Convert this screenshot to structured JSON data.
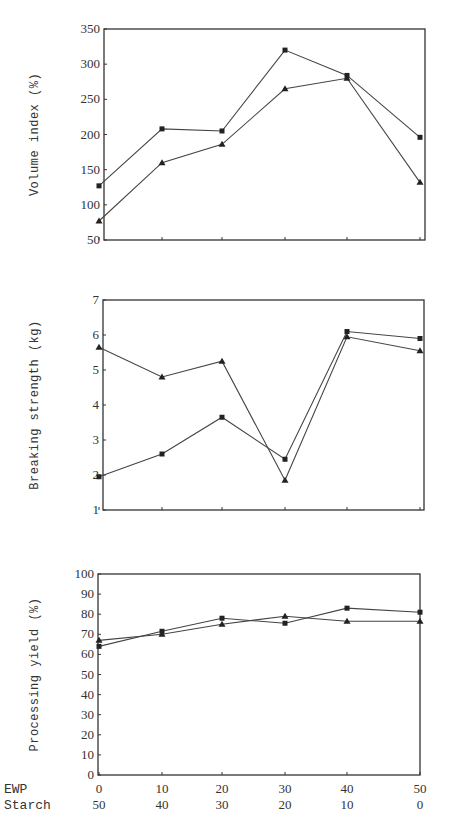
{
  "chart_data": [
    {
      "type": "line",
      "title": "",
      "xlabel": "EWP / Starch",
      "ylabel": "Volume index (%)",
      "x": [
        0,
        10,
        20,
        30,
        40,
        50
      ],
      "x_secondary": [
        50,
        40,
        30,
        20,
        10,
        0
      ],
      "ylim": [
        50,
        350
      ],
      "yticks": [
        50,
        100,
        150,
        200,
        250,
        300,
        350
      ],
      "grid": false,
      "series": [
        {
          "name": "square-marker",
          "marker": "square",
          "values": [
            127,
            208,
            205,
            320,
            284,
            196
          ]
        },
        {
          "name": "triangle-marker",
          "marker": "triangle",
          "values": [
            77,
            160,
            186,
            265,
            280,
            132
          ]
        }
      ]
    },
    {
      "type": "line",
      "title": "",
      "xlabel": "EWP / Starch",
      "ylabel": "Breaking strength (kg)",
      "x": [
        0,
        10,
        20,
        30,
        40,
        50
      ],
      "x_secondary": [
        50,
        40,
        30,
        20,
        10,
        0
      ],
      "ylim": [
        1,
        7
      ],
      "yticks": [
        1,
        2,
        3,
        4,
        5,
        6,
        7
      ],
      "grid": false,
      "series": [
        {
          "name": "square-marker",
          "marker": "square",
          "values": [
            1.95,
            2.6,
            3.65,
            2.45,
            6.1,
            5.9
          ]
        },
        {
          "name": "triangle-marker",
          "marker": "triangle",
          "values": [
            5.65,
            4.8,
            5.25,
            1.85,
            5.95,
            5.55
          ]
        }
      ]
    },
    {
      "type": "line",
      "title": "",
      "xlabel": "EWP / Starch",
      "ylabel": "Processing yield (%)",
      "x": [
        0,
        10,
        20,
        30,
        40,
        50
      ],
      "x_secondary": [
        50,
        40,
        30,
        20,
        10,
        0
      ],
      "ylim": [
        0,
        100
      ],
      "yticks": [
        0,
        10,
        20,
        30,
        40,
        50,
        60,
        70,
        80,
        90,
        100
      ],
      "grid": false,
      "series": [
        {
          "name": "square-marker",
          "marker": "square",
          "values": [
            64,
            71.5,
            78,
            75.5,
            83,
            81
          ]
        },
        {
          "name": "triangle-marker",
          "marker": "triangle",
          "values": [
            67,
            70,
            75,
            79,
            76.5,
            76.5
          ]
        }
      ]
    }
  ],
  "x_axis": {
    "row1_label": "EWP",
    "row2_label": "Starch",
    "row1_ticks": [
      "0",
      "10",
      "20",
      "30",
      "40",
      "50"
    ],
    "row2_ticks": [
      "50",
      "40",
      "30",
      "20",
      "10",
      "0"
    ]
  }
}
